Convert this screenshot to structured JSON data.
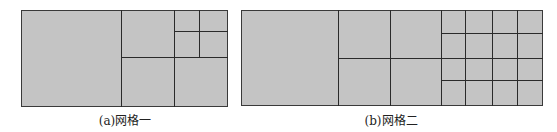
{
  "figures": [
    {
      "id": "a",
      "caption": "(a)网格一",
      "box": {
        "x": 21,
        "y": 10,
        "w": 207,
        "h": 97
      },
      "vlines": [
        {
          "x": 121,
          "y1": 10,
          "y2": 107
        },
        {
          "x": 174,
          "y1": 10,
          "y2": 107
        },
        {
          "x": 199,
          "y1": 10,
          "y2": 57
        }
      ],
      "hlines": [
        {
          "y": 31,
          "x1": 174,
          "x2": 228
        },
        {
          "y": 57,
          "x1": 121,
          "x2": 228
        }
      ],
      "caption_x": 125,
      "caption_y": 111
    },
    {
      "id": "b",
      "caption": "(b)网格二",
      "box": {
        "x": 241,
        "y": 10,
        "w": 302,
        "h": 96
      },
      "vlines": [
        {
          "x": 338,
          "y1": 10,
          "y2": 106
        },
        {
          "x": 390,
          "y1": 10,
          "y2": 106
        },
        {
          "x": 441,
          "y1": 10,
          "y2": 106
        },
        {
          "x": 465,
          "y1": 10,
          "y2": 106
        },
        {
          "x": 492,
          "y1": 10,
          "y2": 106
        },
        {
          "x": 517,
          "y1": 10,
          "y2": 106
        }
      ],
      "hlines": [
        {
          "y": 33,
          "x1": 441,
          "x2": 543
        },
        {
          "y": 58,
          "x1": 338,
          "x2": 543
        },
        {
          "y": 80,
          "x1": 441,
          "x2": 543
        }
      ],
      "caption_x": 391,
      "caption_y": 111
    }
  ],
  "colors": {
    "cell_fill": "#c4c4c4",
    "line": "#2a2a2a",
    "caption": "#222222"
  }
}
